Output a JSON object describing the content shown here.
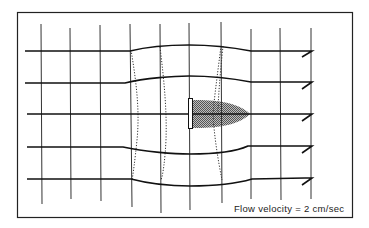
{
  "diagram": {
    "type": "flow-field",
    "caption": "Flow velocity = 2 cm/sec",
    "colors": {
      "line": "#1a1a1a",
      "frame": "#222222",
      "wake_fill": "#8a8a8a",
      "background": "#ffffff"
    },
    "elements": {
      "streamlines": 5,
      "vertical_markers": 10,
      "dotted_isolines": 4,
      "obstacle": "thin vertical plate at center with shaded wake downstream"
    }
  }
}
